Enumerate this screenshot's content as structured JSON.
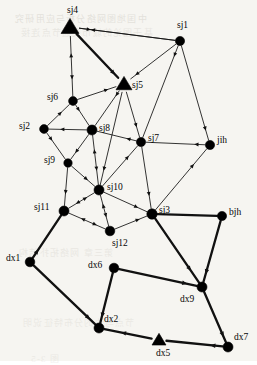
{
  "figure": {
    "width": 257,
    "height": 361,
    "background_color": "#f6f5f1",
    "edge_color": "#111111",
    "node_color": "#000000"
  },
  "chart_data": {
    "type": "scatter",
    "title": "",
    "xlabel": "",
    "ylabel": "",
    "grid": false,
    "legend": "none",
    "xlim": [
      0,
      257
    ],
    "ylim": [
      0,
      361
    ],
    "nodes": [
      {
        "id": "sj4",
        "label": "sj4",
        "x": 70,
        "y": 27,
        "marker": "triangle",
        "size": 9,
        "label_dx": -3,
        "label_dy": -16
      },
      {
        "id": "sj1",
        "label": "sj1",
        "x": 180,
        "y": 41,
        "marker": "circle",
        "size": 4.6,
        "label_dx": -3,
        "label_dy": -15
      },
      {
        "id": "sj5",
        "label": "sj5",
        "x": 124,
        "y": 84,
        "marker": "triangle",
        "size": 8,
        "label_dx": 8,
        "label_dy": 2
      },
      {
        "id": "sj6",
        "label": "sj6",
        "x": 73,
        "y": 101,
        "marker": "circle",
        "size": 4.4,
        "label_dx": -26,
        "label_dy": -3
      },
      {
        "id": "sj2",
        "label": "sj2",
        "x": 44,
        "y": 129,
        "marker": "circle",
        "size": 4.4,
        "label_dx": -25,
        "label_dy": -2
      },
      {
        "id": "sj8",
        "label": "sj8",
        "x": 92,
        "y": 130,
        "marker": "circle",
        "size": 5.0,
        "label_dx": 7,
        "label_dy": -1
      },
      {
        "id": "sj7",
        "label": "sj7",
        "x": 141,
        "y": 142,
        "marker": "circle",
        "size": 4.6,
        "label_dx": 7,
        "label_dy": -3
      },
      {
        "id": "jih",
        "label": "jih",
        "x": 210,
        "y": 145,
        "marker": "circle",
        "size": 4.6,
        "label_dx": 7,
        "label_dy": -4
      },
      {
        "id": "sj9",
        "label": "sj9",
        "x": 68,
        "y": 163,
        "marker": "circle",
        "size": 4.2,
        "label_dx": -24,
        "label_dy": -2
      },
      {
        "id": "sj10",
        "label": "sj10",
        "x": 99,
        "y": 190,
        "marker": "circle",
        "size": 5.0,
        "label_dx": 8,
        "label_dy": -2
      },
      {
        "id": "sj11",
        "label": "sj11",
        "x": 64,
        "y": 211,
        "marker": "circle",
        "size": 5.0,
        "label_dx": -30,
        "label_dy": -3
      },
      {
        "id": "sj3",
        "label": "sj3",
        "x": 152,
        "y": 214,
        "marker": "circle",
        "size": 5.2,
        "label_dx": 7,
        "label_dy": -3
      },
      {
        "id": "bjh",
        "label": "bjh",
        "x": 222,
        "y": 216,
        "marker": "circle",
        "size": 4.6,
        "label_dx": 7,
        "label_dy": -3
      },
      {
        "id": "sj12",
        "label": "sj12",
        "x": 110,
        "y": 231,
        "marker": "circle",
        "size": 4.8,
        "label_dx": 2,
        "label_dy": 13
      },
      {
        "id": "dx1",
        "label": "dx1",
        "x": 30,
        "y": 262,
        "marker": "circle",
        "size": 4.8,
        "label_dx": -24,
        "label_dy": -3
      },
      {
        "id": "dx6",
        "label": "dx6",
        "x": 114,
        "y": 268,
        "marker": "circle",
        "size": 4.8,
        "label_dx": -26,
        "label_dy": -2
      },
      {
        "id": "dx9",
        "label": "dx9",
        "x": 202,
        "y": 287,
        "marker": "circle",
        "size": 5.0,
        "label_dx": -22,
        "label_dy": 13
      },
      {
        "id": "dx2",
        "label": "dx2",
        "x": 99,
        "y": 328,
        "marker": "circle",
        "size": 5.0,
        "label_dx": 5,
        "label_dy": -8
      },
      {
        "id": "dx5",
        "label": "dx5",
        "x": 159,
        "y": 340,
        "marker": "triangle",
        "size": 7,
        "label_dx": -3,
        "label_dy": 14
      },
      {
        "id": "dx7",
        "label": "dx7",
        "x": 228,
        "y": 347,
        "marker": "circle",
        "size": 5.0,
        "label_dx": 6,
        "label_dy": -9
      }
    ],
    "edges": [
      {
        "from": "sj4",
        "to": "sj1",
        "weight": "thin",
        "arrow": "forward",
        "arrow_pos": 0.12
      },
      {
        "from": "sj1",
        "to": "sj4",
        "weight": "thin",
        "arrow": "forward",
        "arrow_pos": 0.88
      },
      {
        "from": "sj4",
        "to": "sj5",
        "weight": "thick",
        "arrow": "forward",
        "arrow_pos": 0.93
      },
      {
        "from": "sj4",
        "to": "sj6",
        "weight": "thin",
        "arrow": "both",
        "arrow_pos": 0.5
      },
      {
        "from": "sj1",
        "to": "sj5",
        "weight": "thin",
        "arrow": "forward",
        "arrow_pos": 0.9
      },
      {
        "from": "sj1",
        "to": "sj7",
        "weight": "thin",
        "arrow": "forward",
        "arrow_pos": 0.12
      },
      {
        "from": "sj1",
        "to": "jih",
        "weight": "thin",
        "arrow": "forward",
        "arrow_pos": 0.9
      },
      {
        "from": "sj5",
        "to": "sj6",
        "weight": "thin",
        "arrow": "backward",
        "arrow_pos": 0.2
      },
      {
        "from": "sj5",
        "to": "sj8",
        "weight": "thin",
        "arrow": "forward",
        "arrow_pos": 0.15
      },
      {
        "from": "sj5",
        "to": "sj7",
        "weight": "thin",
        "arrow": "forward",
        "arrow_pos": 0.78
      },
      {
        "from": "sj6",
        "to": "sj2",
        "weight": "thin",
        "arrow": "backward",
        "arrow_pos": 0.35
      },
      {
        "from": "sj6",
        "to": "sj8",
        "weight": "thin",
        "arrow": "forward",
        "arrow_pos": 0.3
      },
      {
        "from": "sj2",
        "to": "sj8",
        "weight": "thin",
        "arrow": "backward",
        "arrow_pos": 0.3
      },
      {
        "from": "sj2",
        "to": "sj9",
        "weight": "thin",
        "arrow": "forward",
        "arrow_pos": 0.3
      },
      {
        "from": "sj8",
        "to": "sj7",
        "weight": "thin",
        "arrow": "backward",
        "arrow_pos": 0.75
      },
      {
        "from": "sj8",
        "to": "sj9",
        "weight": "thin",
        "arrow": "forward",
        "arrow_pos": 0.75
      },
      {
        "from": "sj8",
        "to": "sj10",
        "weight": "thin",
        "arrow": "both",
        "arrow_pos": 0.5
      },
      {
        "from": "sj7",
        "to": "jih",
        "weight": "thin",
        "arrow": "backward",
        "arrow_pos": 0.82
      },
      {
        "from": "sj7",
        "to": "sj10",
        "weight": "thin",
        "arrow": "backward",
        "arrow_pos": 0.25
      },
      {
        "from": "sj7",
        "to": "sj3",
        "weight": "thin",
        "arrow": "forward",
        "arrow_pos": 0.8
      },
      {
        "from": "jih",
        "to": "sj3",
        "weight": "thin",
        "arrow": "backward",
        "arrow_pos": 0.25
      },
      {
        "from": "sj9",
        "to": "sj10",
        "weight": "thin",
        "arrow": "forward",
        "arrow_pos": 0.7
      },
      {
        "from": "sj9",
        "to": "sj11",
        "weight": "thin",
        "arrow": "forward",
        "arrow_pos": 0.7
      },
      {
        "from": "sj10",
        "to": "sj11",
        "weight": "thin",
        "arrow": "both",
        "arrow_pos": 0.5
      },
      {
        "from": "sj10",
        "to": "sj12",
        "weight": "thin",
        "arrow": "both",
        "arrow_pos": 0.5
      },
      {
        "from": "sj10",
        "to": "sj3",
        "weight": "thin",
        "arrow": "forward",
        "arrow_pos": 0.8
      },
      {
        "from": "sj11",
        "to": "sj12",
        "weight": "thin",
        "arrow": "both",
        "arrow_pos": 0.55
      },
      {
        "from": "sj12",
        "to": "sj3",
        "weight": "thin",
        "arrow": "forward",
        "arrow_pos": 0.78
      },
      {
        "from": "sj5",
        "to": "sj10",
        "weight": "thin",
        "arrow": "forward",
        "arrow_pos": 0.85
      },
      {
        "from": "sj3",
        "to": "bjh",
        "weight": "thick",
        "arrow": "none",
        "arrow_pos": 0.5
      },
      {
        "from": "sj3",
        "to": "dx9",
        "weight": "thick",
        "arrow": "forward",
        "arrow_pos": 0.82
      },
      {
        "from": "bjh",
        "to": "dx9",
        "weight": "thick",
        "arrow": "forward",
        "arrow_pos": 0.88
      },
      {
        "from": "sj11",
        "to": "dx1",
        "weight": "thick",
        "arrow": "backward",
        "arrow_pos": 0.8
      },
      {
        "from": "dx1",
        "to": "dx2",
        "weight": "thick",
        "arrow": "forward",
        "arrow_pos": 0.92
      },
      {
        "from": "dx6",
        "to": "dx2",
        "weight": "thick",
        "arrow": "forward",
        "arrow_pos": 0.9
      },
      {
        "from": "dx6",
        "to": "dx9",
        "weight": "thick",
        "arrow": "forward",
        "arrow_pos": 0.88
      },
      {
        "from": "dx2",
        "to": "dx5",
        "weight": "thick",
        "arrow": "backward",
        "arrow_pos": 0.35
      },
      {
        "from": "dx5",
        "to": "dx7",
        "weight": "thick",
        "arrow": "backward",
        "arrow_pos": 0.78
      },
      {
        "from": "dx9",
        "to": "dx7",
        "weight": "thick",
        "arrow": "forward",
        "arrow_pos": 0.9
      }
    ]
  },
  "bleed_text": [
    {
      "text": "中国地图网络分析与应用研究",
      "x": 14,
      "y": 12,
      "size": 9,
      "opacity": 0.3
    },
    {
      "text": "基于图论的城市交通节点连接",
      "x": 20,
      "y": 26,
      "size": 9,
      "opacity": 0.22
    },
    {
      "text": "第三章 网络拓扑结构",
      "x": 18,
      "y": 246,
      "size": 9,
      "opacity": 0.2
    },
    {
      "text": "节点与边的分布特征说明",
      "x": 22,
      "y": 316,
      "size": 9,
      "opacity": 0.18
    },
    {
      "text": "图 3-5",
      "x": 30,
      "y": 352,
      "size": 9,
      "opacity": 0.18
    }
  ]
}
